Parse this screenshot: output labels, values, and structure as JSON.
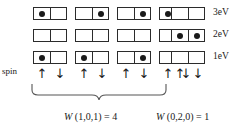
{
  "diagram": {
    "spin_label": "spin",
    "spin_up_glyph": "↑",
    "spin_down_glyph": "↓",
    "energy_levels": [
      {
        "label": "3eV",
        "value": 3
      },
      {
        "label": "2eV",
        "value": 2
      },
      {
        "label": "1eV",
        "value": 1
      }
    ],
    "columns": [
      {
        "name": "microstate-1",
        "occupancy": {
          "3eV": [
            1,
            0
          ],
          "2eV": [
            0,
            0
          ],
          "1eV": [
            1,
            0
          ]
        }
      },
      {
        "name": "microstate-2",
        "occupancy": {
          "3eV": [
            0,
            1
          ],
          "2eV": [
            0,
            0
          ],
          "1eV": [
            1,
            0
          ]
        }
      },
      {
        "name": "microstate-3",
        "occupancy": {
          "3eV": [
            0,
            1
          ],
          "2eV": [
            0,
            0
          ],
          "1eV": [
            0,
            1
          ]
        }
      },
      {
        "name": "microstate-4",
        "occupancy": {
          "3eV": [
            1,
            0
          ],
          "2eV": [
            0,
            0
          ],
          "1eV": [
            0,
            1
          ]
        }
      },
      {
        "name": "microstate-5",
        "occupancy": {
          "3eV": [
            0,
            0
          ],
          "2eV": [
            1,
            1
          ],
          "1eV": [
            0,
            0
          ]
        }
      }
    ],
    "groups": [
      {
        "name": "group-left",
        "braced": true,
        "columns": [
          0,
          1,
          2,
          3
        ],
        "w_symbol": "W",
        "w_args": "(1,0,1)",
        "w_equals": "=",
        "w_value": "4",
        "full_text": "W (1,0,1) = 4"
      },
      {
        "name": "group-right",
        "braced": false,
        "columns": [
          4
        ],
        "w_symbol": "W",
        "w_args": "(0,2,0)",
        "w_equals": "=",
        "w_value": "1",
        "full_text": "W (0,2,0) = 1"
      }
    ],
    "colors": {
      "stroke": "#2b2b2b",
      "dot": "#1a1a1a",
      "background": "#ffffff",
      "brace": "#555555"
    }
  }
}
